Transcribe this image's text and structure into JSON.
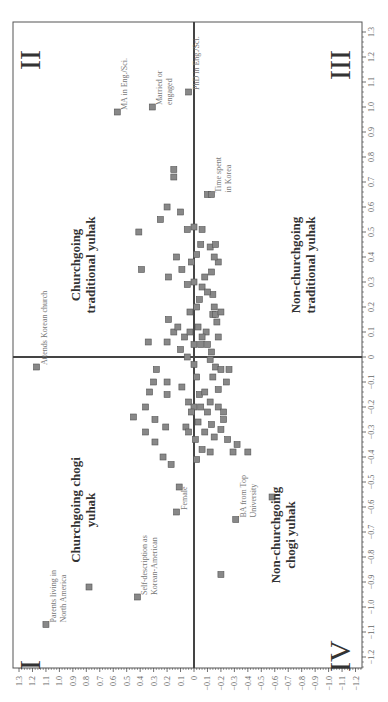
{
  "chart_data": {
    "type": "scatter",
    "orientation": "rotated 90 degrees (read with page turned clockwise)",
    "title": "",
    "xlabel": "",
    "ylabel": "",
    "horizontal_axis": {
      "ticks": [
        "1.3",
        "1.2",
        "1.1",
        "1.0",
        "0.9",
        "0.8",
        "0.7",
        "0.6",
        "0.5",
        "0.4",
        "0.3",
        "0.2",
        "0.1",
        "0",
        "-0.1",
        "-0.2",
        "-0.3",
        "-0.4",
        "-0.5",
        "-0.6",
        "-0.7",
        "-0.8",
        "-0.9",
        "-1.0",
        "-1.1",
        "-1.2"
      ],
      "range": [
        1.3,
        -1.2
      ]
    },
    "vertical_axis": {
      "ticks": [
        "1.3",
        "1.2",
        "1.1",
        "1.0",
        "0.9",
        "0.8",
        "0.7",
        "0.6",
        "0.5",
        "0.4",
        "0.3",
        "0.2",
        "0.1",
        "0",
        "-0.1",
        "-0.2",
        "-0.3",
        "-0.4",
        "-0.5",
        "-0.6",
        "-0.7",
        "-0.8",
        "-0.9",
        "-1.0",
        "-1.1",
        "-1.2"
      ],
      "range": [
        1.3,
        -1.2
      ]
    },
    "grid": false,
    "quadrants": [
      {
        "numeral": "I",
        "label": [
          "Churchgoing chogi",
          "yuhak"
        ]
      },
      {
        "numeral": "II",
        "label": [
          "Churchgoing",
          "traditional yuhak"
        ]
      },
      {
        "numeral": "III",
        "label": [
          "Non-churchgoing",
          "traditional yuhak"
        ]
      },
      {
        "numeral": "IV",
        "label": [
          "Non-churchgoing",
          "chogi yuhak"
        ]
      }
    ],
    "labeled_points": [
      {
        "label": [
          "MA in Eng./Sci."
        ],
        "h": 0.57,
        "v": 0.98
      },
      {
        "label": [
          "Married or",
          "engaged"
        ],
        "h": 0.31,
        "v": 1.0
      },
      {
        "label": [
          "PhD in Eng./Sci."
        ],
        "h": 0.04,
        "v": 1.06
      },
      {
        "label": [
          "Time spent",
          "in Korea"
        ],
        "h": -0.13,
        "v": 0.65
      },
      {
        "label": [
          "Attends Korean church"
        ],
        "h": 1.17,
        "v": -0.04
      },
      {
        "label": [
          "Parents living in",
          "North America"
        ],
        "h": 1.1,
        "v": -1.07
      },
      {
        "label": [
          "Self-description as",
          "Korean-American"
        ],
        "h": 0.42,
        "v": -0.96
      },
      {
        "label": [
          "Female"
        ],
        "h": 0.13,
        "v": -0.62
      },
      {
        "label": [
          "BA from Top",
          "University"
        ],
        "h": -0.31,
        "v": -0.65
      },
      {
        "label": [],
        "h": -0.58,
        "v": -0.56
      }
    ],
    "points": [
      [
        0.78,
        -0.92
      ],
      [
        -0.2,
        -0.87
      ],
      [
        0.11,
        -0.52
      ],
      [
        0.17,
        -0.43
      ],
      [
        -0.02,
        -0.41
      ],
      [
        -0.29,
        -0.38
      ],
      [
        -0.4,
        -0.38
      ],
      [
        0.15,
        0.75
      ],
      [
        0.15,
        0.72
      ],
      [
        0.41,
        0.5
      ],
      [
        0.2,
        0.6
      ],
      [
        0.1,
        0.58
      ],
      [
        -0.1,
        0.65
      ],
      [
        0.0,
        0.52
      ],
      [
        0.05,
        0.51
      ],
      [
        -0.06,
        0.51
      ],
      [
        0.39,
        0.35
      ],
      [
        0.19,
        0.32
      ],
      [
        0.05,
        0.29
      ],
      [
        0.0,
        0.3
      ],
      [
        -0.06,
        0.28
      ],
      [
        -0.14,
        0.25
      ],
      [
        -0.15,
        0.2
      ],
      [
        -0.14,
        0.17
      ],
      [
        -0.16,
        0.17
      ],
      [
        -0.2,
        0.18
      ],
      [
        -0.17,
        0.14
      ],
      [
        0.34,
        0.06
      ],
      [
        0.2,
        0.06
      ],
      [
        0.1,
        0.03
      ],
      [
        0.05,
        0.0
      ],
      [
        0.0,
        0.05
      ],
      [
        -0.05,
        0.05
      ],
      [
        -0.13,
        0.02
      ],
      [
        -0.12,
        -0.01
      ],
      [
        -0.16,
        -0.04
      ],
      [
        -0.2,
        -0.05
      ],
      [
        -0.26,
        -0.05
      ],
      [
        0.28,
        -0.05
      ],
      [
        0.2,
        -0.1
      ],
      [
        0.15,
        0.1
      ],
      [
        0.0,
        -0.03
      ],
      [
        -0.02,
        -0.08
      ],
      [
        -0.04,
        -0.15
      ],
      [
        -0.08,
        -0.14
      ],
      [
        -0.12,
        -0.18
      ],
      [
        -0.05,
        -0.2
      ],
      [
        -0.1,
        -0.22
      ],
      [
        -0.18,
        -0.2
      ],
      [
        -0.22,
        -0.25
      ],
      [
        0.19,
        0.15
      ],
      [
        0.12,
        0.12
      ],
      [
        0.07,
        0.08
      ],
      [
        0.03,
        0.1
      ],
      [
        -0.03,
        0.12
      ],
      [
        -0.09,
        0.1
      ],
      [
        -0.06,
        0.08
      ],
      [
        -0.1,
        0.05
      ],
      [
        -0.18,
        0.08
      ],
      [
        0.3,
        -0.1
      ],
      [
        0.33,
        -0.14
      ],
      [
        0.2,
        -0.15
      ],
      [
        0.09,
        -0.12
      ],
      [
        0.04,
        -0.18
      ],
      [
        0.0,
        -0.2
      ],
      [
        -0.03,
        -0.26
      ],
      [
        -0.08,
        -0.3
      ],
      [
        -0.13,
        -0.27
      ],
      [
        -0.2,
        -0.29
      ],
      [
        -0.25,
        -0.33
      ],
      [
        -0.32,
        -0.35
      ],
      [
        0.36,
        -0.2
      ],
      [
        0.29,
        -0.25
      ],
      [
        0.21,
        -0.28
      ],
      [
        0.06,
        -0.28
      ],
      [
        0.02,
        -0.22
      ],
      [
        -0.01,
        -0.33
      ],
      [
        -0.12,
        -0.38
      ],
      [
        -0.15,
        -0.32
      ],
      [
        -0.22,
        -0.22
      ],
      [
        0.45,
        -0.24
      ],
      [
        0.36,
        -0.3
      ],
      [
        0.29,
        -0.34
      ],
      [
        0.23,
        -0.4
      ],
      [
        0.04,
        -0.3
      ],
      [
        -0.06,
        -0.37
      ],
      [
        -0.18,
        -0.13
      ],
      [
        -0.24,
        -0.1
      ],
      [
        -0.14,
        -0.08
      ],
      [
        0.03,
        0.18
      ],
      [
        -0.02,
        0.2
      ],
      [
        -0.04,
        0.23
      ],
      [
        -0.1,
        0.26
      ],
      [
        -0.08,
        0.32
      ],
      [
        -0.13,
        0.34
      ],
      [
        -0.18,
        0.38
      ],
      [
        -0.15,
        0.4
      ],
      [
        -0.12,
        0.44
      ],
      [
        -0.16,
        0.45
      ],
      [
        0.02,
        0.38
      ],
      [
        -0.02,
        0.41
      ],
      [
        -0.05,
        0.45
      ],
      [
        0.09,
        0.35
      ],
      [
        0.13,
        0.4
      ],
      [
        0.25,
        0.55
      ]
    ]
  },
  "styles": {
    "point_fill": "#888888",
    "point_stroke": "#555555",
    "axis_color": "#333333",
    "zero_line_color": "#444444",
    "label_color": "#777777",
    "quadrant_label_color": "#333333"
  }
}
